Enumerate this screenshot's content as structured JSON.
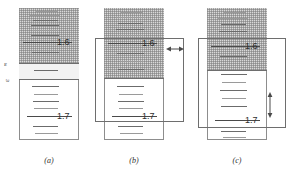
{
  "figure": {
    "type": "spectral-line-diagram",
    "panel_count": 3
  },
  "colors": {
    "shaded_band": "#d9d9d9",
    "mid_band": "#f2f2f2",
    "line": "#6b6b6b",
    "frame": "#8d8d8d",
    "text": "#2e2e2e"
  },
  "labels": {
    "wavelength_upper": "1.6",
    "wavelength_lower": "1.7",
    "epsilon_1": "ε",
    "epsilon_2": "ε"
  },
  "captions": {
    "a": "(a)",
    "b": "(b)",
    "c": "(c)"
  },
  "panels": [
    {
      "id": "a",
      "caption": "(a)",
      "has_overlay": false,
      "arrow": "none",
      "wavelength_upper": "1.6",
      "wavelength_lower": "1.7",
      "epsilon_labels": [
        "ε",
        "ε"
      ],
      "lines_upper": [
        {
          "top": 11,
          "left": 36,
          "width": 22,
          "weight": "faint"
        },
        {
          "top": 15,
          "left": 30,
          "width": 30,
          "weight": "faint"
        },
        {
          "top": 20,
          "left": 33,
          "width": 25,
          "weight": "normal"
        },
        {
          "top": 25,
          "left": 31,
          "width": 28,
          "weight": "normal"
        },
        {
          "top": 30,
          "left": 33,
          "width": 25,
          "weight": "faint"
        },
        {
          "top": 35,
          "left": 31,
          "width": 28,
          "weight": "normal"
        },
        {
          "top": 41,
          "left": 29,
          "width": 31,
          "weight": "normal"
        },
        {
          "top": 50,
          "left": 22,
          "width": 37,
          "weight": "thick"
        },
        {
          "top": 57,
          "left": 31,
          "width": 27,
          "weight": "normal"
        }
      ],
      "lines_mid": [
        {
          "top": 72,
          "left": 33,
          "width": 24,
          "weight": "normal"
        }
      ],
      "lines_lower": [
        {
          "top": 86,
          "left": 31,
          "width": 27,
          "weight": "normal"
        },
        {
          "top": 94,
          "left": 33,
          "width": 24,
          "weight": "faint"
        },
        {
          "top": 101,
          "left": 32,
          "width": 26,
          "weight": "normal"
        },
        {
          "top": 108,
          "left": 33,
          "width": 24,
          "weight": "faint"
        },
        {
          "top": 116,
          "left": 26,
          "width": 33,
          "weight": "thick"
        },
        {
          "top": 126,
          "left": 32,
          "width": 25,
          "weight": "normal"
        },
        {
          "top": 133,
          "left": 34,
          "width": 23,
          "weight": "faint"
        }
      ]
    },
    {
      "id": "b",
      "caption": "(b)",
      "has_overlay": true,
      "arrow": "horizontal-double",
      "wavelength_upper": "1.6",
      "wavelength_lower": "1.7"
    },
    {
      "id": "c",
      "caption": "(c)",
      "has_overlay": true,
      "arrow": "vertical-double",
      "wavelength_upper": "1.6",
      "wavelength_lower": "1.7"
    }
  ]
}
